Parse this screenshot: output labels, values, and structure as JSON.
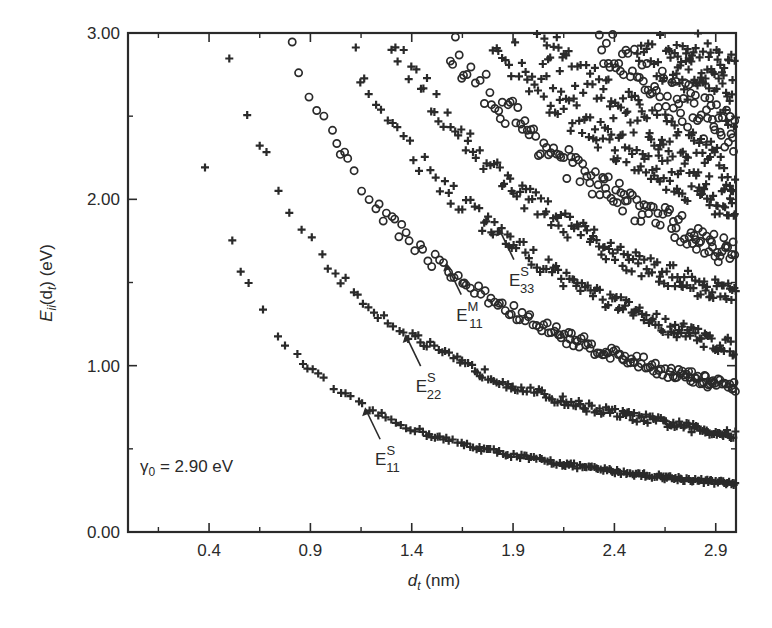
{
  "chart_data": {
    "type": "scatter",
    "title": "",
    "xlabel": "d_t (nm)",
    "ylabel": "E_ii(d_t) (eV)",
    "xlim": [
      0.0,
      3.0
    ],
    "ylim": [
      0.0,
      3.0
    ],
    "x_ticks": [
      0.4,
      0.9,
      1.4,
      1.9,
      2.4,
      2.9
    ],
    "x_tick_labels": [
      "0.4",
      "0.9",
      "1.4",
      "1.9",
      "2.4",
      "2.9"
    ],
    "x_minor_ticks": [
      0.15,
      0.65,
      1.15,
      1.65,
      2.15,
      2.65
    ],
    "y_ticks": [
      0.0,
      1.0,
      2.0,
      3.0
    ],
    "y_tick_labels": [
      "0.00",
      "1.00",
      "2.00",
      "3.00"
    ],
    "y_minor_ticks": [
      0.5,
      1.5,
      2.5
    ],
    "grid": false,
    "legend": null,
    "markers": {
      "semiconducting": "+",
      "metallic": "o"
    },
    "series": [
      {
        "name": "E11^S",
        "marker": "+",
        "type": "semiconducting",
        "approx_points": [
          [
            0.38,
            2.22
          ],
          [
            0.5,
            1.78
          ],
          [
            0.7,
            1.25
          ],
          [
            1.0,
            0.88
          ],
          [
            1.2,
            0.73
          ],
          [
            1.5,
            0.58
          ],
          [
            2.0,
            0.44
          ],
          [
            2.5,
            0.35
          ],
          [
            3.0,
            0.29
          ]
        ]
      },
      {
        "name": "E22^S",
        "marker": "+",
        "type": "semiconducting",
        "approx_points": [
          [
            0.5,
            2.86
          ],
          [
            0.7,
            2.2
          ],
          [
            0.9,
            1.75
          ],
          [
            1.2,
            1.35
          ],
          [
            1.4,
            1.18
          ],
          [
            1.8,
            0.93
          ],
          [
            2.2,
            0.77
          ],
          [
            2.6,
            0.67
          ],
          [
            3.0,
            0.58
          ]
        ]
      },
      {
        "name": "E11^M",
        "marker": "o",
        "type": "metallic",
        "approx_points": [
          [
            0.81,
            2.91
          ],
          [
            1.0,
            2.4
          ],
          [
            1.2,
            2.0
          ],
          [
            1.4,
            1.75
          ],
          [
            1.6,
            1.55
          ],
          [
            2.0,
            1.26
          ],
          [
            2.5,
            1.03
          ],
          [
            3.0,
            0.86
          ]
        ]
      },
      {
        "name": "E33^S",
        "marker": "+",
        "type": "semiconducting",
        "approx_points": [
          [
            1.08,
            2.95
          ],
          [
            1.3,
            2.45
          ],
          [
            1.6,
            2.03
          ],
          [
            1.85,
            1.78
          ],
          [
            2.2,
            1.5
          ],
          [
            2.6,
            1.27
          ],
          [
            3.0,
            1.1
          ]
        ]
      },
      {
        "name": "E44^S",
        "marker": "+",
        "type": "semiconducting",
        "approx_points": [
          [
            1.3,
            2.98
          ],
          [
            1.6,
            2.45
          ],
          [
            2.0,
            1.98
          ],
          [
            2.5,
            1.62
          ],
          [
            3.0,
            1.42
          ]
        ]
      },
      {
        "name": "E22^M",
        "marker": "o",
        "type": "metallic",
        "approx_points": [
          [
            1.55,
            2.98
          ],
          [
            1.9,
            2.5
          ],
          [
            2.3,
            2.1
          ],
          [
            2.7,
            1.84
          ],
          [
            3.0,
            1.66
          ]
        ]
      },
      {
        "name": "E55^S",
        "marker": "+",
        "type": "semiconducting",
        "approx_points": [
          [
            1.8,
            2.98
          ],
          [
            2.2,
            2.5
          ],
          [
            2.6,
            2.2
          ],
          [
            3.0,
            1.95
          ]
        ]
      },
      {
        "name": "E66^S",
        "marker": "+",
        "type": "semiconducting",
        "approx_points": [
          [
            2.0,
            2.98
          ],
          [
            2.4,
            2.6
          ],
          [
            3.0,
            2.15
          ]
        ]
      },
      {
        "name": "E33^M",
        "marker": "o",
        "type": "metallic",
        "approx_points": [
          [
            2.3,
            2.98
          ],
          [
            2.7,
            2.6
          ],
          [
            3.0,
            2.4
          ]
        ]
      },
      {
        "name": "E77^S",
        "marker": "+",
        "type": "semiconducting",
        "approx_points": [
          [
            2.5,
            2.98
          ],
          [
            3.0,
            2.55
          ]
        ]
      },
      {
        "name": "E88^S",
        "marker": "+",
        "type": "semiconducting",
        "approx_points": [
          [
            2.7,
            2.98
          ],
          [
            3.0,
            2.75
          ]
        ]
      }
    ],
    "annotations": [
      {
        "text": "γ0 = 2.90 eV",
        "x": 0.1,
        "y": 0.37
      },
      {
        "label": "E",
        "super": "S",
        "sub": "11",
        "arrow_to": [
          1.17,
          0.75
        ]
      },
      {
        "label": "E",
        "super": "S",
        "sub": "22",
        "arrow_to": [
          1.37,
          1.19
        ]
      },
      {
        "label": "E",
        "super": "M",
        "sub": "11",
        "arrow_to": [
          1.57,
          1.62
        ]
      },
      {
        "label": "E",
        "super": "S",
        "sub": "33",
        "arrow_to": [
          1.83,
          1.83
        ]
      }
    ]
  },
  "labels": {
    "x_axis_main": "d",
    "x_axis_sub": "t",
    "x_axis_unit": " (nm)",
    "y_axis_main": "E",
    "y_axis_sub": "ii",
    "y_axis_mid": "(d",
    "y_axis_sub2": "t",
    "y_axis_unit": ") (eV)",
    "gamma_symbol": "γ",
    "gamma_sub": "0",
    "gamma_value": " = 2.90 eV"
  }
}
